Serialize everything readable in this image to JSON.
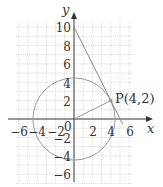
{
  "diagram": {
    "type": "coordinate-plane",
    "title": "",
    "axes": {
      "x_label": "x",
      "y_label": "y",
      "origin_label": "0",
      "x_ticks": [
        -6,
        -4,
        -2,
        2,
        4,
        6
      ],
      "y_ticks": [
        10,
        8,
        6,
        4,
        2,
        -2,
        -4,
        -6
      ],
      "x_range": [
        -6.3,
        6.3
      ],
      "y_range": [
        -7,
        10.5
      ],
      "grid": "dotted, 1 unit"
    },
    "circle": {
      "center": [
        0,
        0
      ],
      "radius_squared": 20
    },
    "point": {
      "label": "P(4,2)",
      "x": 4,
      "y": 2
    },
    "radius_segment": {
      "from": [
        0,
        0
      ],
      "to": [
        4,
        2
      ]
    },
    "tangent_line": {
      "equation": "y = -2x + 10",
      "from": [
        0,
        10
      ],
      "to": [
        5.3,
        -0.6
      ]
    }
  },
  "labels": {
    "x_axis": "x",
    "y_axis": "y",
    "origin": "0",
    "point": "P(4,2)",
    "xt": [
      "−6",
      "−4",
      "−2",
      "2",
      "4",
      "6"
    ],
    "yt": [
      "10",
      "8",
      "6",
      "4",
      "2",
      "−2",
      "−4",
      "−6"
    ]
  }
}
